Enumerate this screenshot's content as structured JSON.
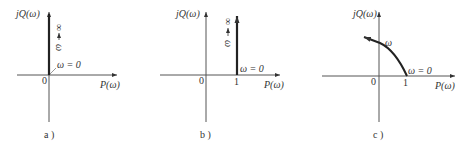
{
  "colors": {
    "axis": "#555555",
    "curve": "#222222",
    "text": "#333333"
  },
  "panels": [
    {
      "id": "a",
      "caption": "a )",
      "y_axis_label": "jQ(ω)",
      "x_axis_label": "P(ω)",
      "origin_label": "0",
      "start_label": "ω = 0",
      "direction_label": "ω",
      "infinity_label": "∞",
      "description": "Locus along positive imaginary axis from origin (ω=0) to ∞"
    },
    {
      "id": "b",
      "caption": "b )",
      "y_axis_label": "jQ(ω)",
      "x_axis_label": "P(ω)",
      "origin_label": "0",
      "unit_label": "1",
      "start_label": "ω = 0",
      "direction_label": "ω",
      "infinity_label": "∞",
      "description": "Vertical line at P=1 from ω=0 upward to ∞"
    },
    {
      "id": "c",
      "caption": "c )",
      "y_axis_label": "jQ(ω)",
      "x_axis_label": "P(ω)",
      "origin_label": "0",
      "unit_label": "1",
      "start_label": "ω = 0",
      "direction_label": "ω",
      "description": "Curve from P=1 (ω=0) arcing up-left into second quadrant"
    }
  ]
}
